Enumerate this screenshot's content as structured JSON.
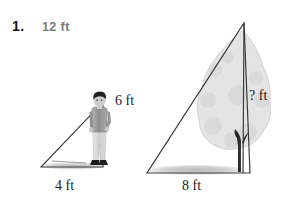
{
  "problem": {
    "number": "1.",
    "type": "similar-triangles-shadow-problem"
  },
  "labels": {
    "hypotenuse_left": "12 ft",
    "person_height": "6 ft",
    "base_left": "4 ft",
    "base_right": "8 ft",
    "tree_height": "? ft"
  },
  "figures": {
    "person": {
      "name": "standing-person",
      "height_label": "6 ft"
    },
    "tree": {
      "name": "tree",
      "height_label": "? ft"
    }
  },
  "colors": {
    "ink": "#1a1a1a",
    "label_gray": "#7b7b7b",
    "foliage": "#e2e2e2",
    "shadow": "#bdbdbd",
    "trunk": "#2e2e2e",
    "person_shirt": "#9a9a9a",
    "person_pants": "#d8d8d8",
    "person_hair": "#1f1f1f"
  }
}
